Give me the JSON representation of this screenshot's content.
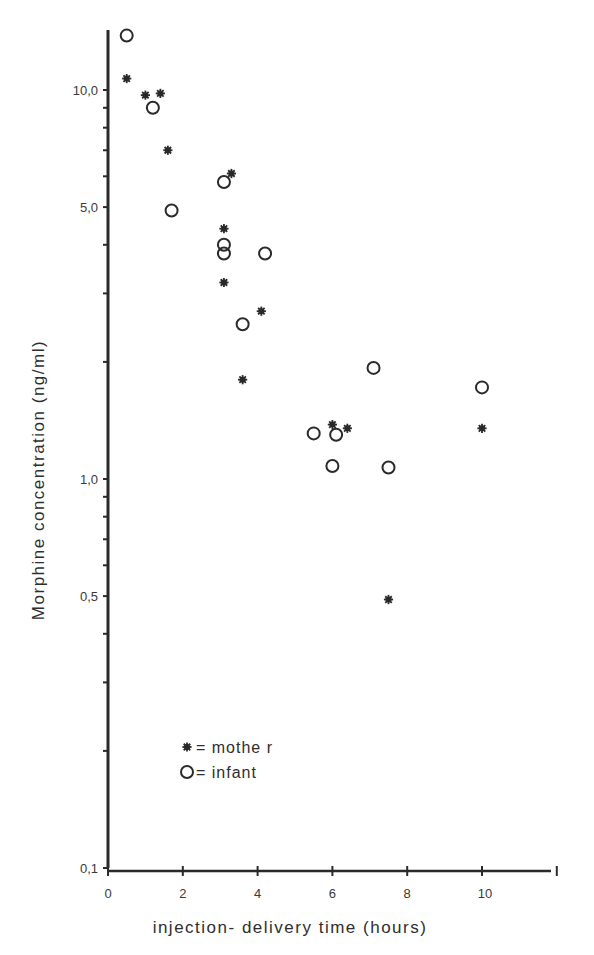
{
  "chart_data": {
    "type": "scatter",
    "title": "",
    "xlabel": "injection- delivery  time  (hours)",
    "ylabel": "Morphine  concentration  (ng/ml)",
    "xlim": [
      0,
      12
    ],
    "ylim": [
      0.1,
      15
    ],
    "yscale": "log",
    "grid": false,
    "legend_position": "lower-left inside",
    "x_ticks": [
      0,
      2,
      4,
      6,
      8,
      10
    ],
    "x_tick_labels": [
      "0",
      "2",
      "4",
      "6",
      "8",
      "10"
    ],
    "y_ticks": [
      0.1,
      0.5,
      1.0,
      5.0,
      10.0
    ],
    "y_tick_labels": [
      "0,1",
      "0,5",
      "1,0",
      "5,0",
      "10,0"
    ],
    "series": [
      {
        "name": "mother",
        "legend_label": "= mothe r",
        "marker": "asterisk",
        "points": [
          {
            "x": 0.5,
            "y": 10.7
          },
          {
            "x": 1.0,
            "y": 9.7
          },
          {
            "x": 1.4,
            "y": 9.8
          },
          {
            "x": 1.6,
            "y": 7.0
          },
          {
            "x": 3.3,
            "y": 6.1
          },
          {
            "x": 3.1,
            "y": 4.4
          },
          {
            "x": 3.1,
            "y": 3.2
          },
          {
            "x": 4.1,
            "y": 2.7
          },
          {
            "x": 3.6,
            "y": 1.8
          },
          {
            "x": 6.0,
            "y": 1.38
          },
          {
            "x": 6.4,
            "y": 1.35
          },
          {
            "x": 10.0,
            "y": 1.35
          },
          {
            "x": 7.5,
            "y": 0.49
          }
        ]
      },
      {
        "name": "infant",
        "legend_label": "= infant",
        "marker": "open-circle",
        "points": [
          {
            "x": 0.5,
            "y": 13.8
          },
          {
            "x": 1.2,
            "y": 9.0
          },
          {
            "x": 1.7,
            "y": 4.9
          },
          {
            "x": 3.1,
            "y": 5.8
          },
          {
            "x": 3.1,
            "y": 4.0
          },
          {
            "x": 3.1,
            "y": 3.8
          },
          {
            "x": 4.2,
            "y": 3.8
          },
          {
            "x": 3.6,
            "y": 2.5
          },
          {
            "x": 7.1,
            "y": 1.93
          },
          {
            "x": 10.0,
            "y": 1.72
          },
          {
            "x": 5.5,
            "y": 1.31
          },
          {
            "x": 6.1,
            "y": 1.3
          },
          {
            "x": 6.0,
            "y": 1.08
          },
          {
            "x": 7.5,
            "y": 1.07
          }
        ]
      }
    ]
  },
  "colors": {
    "ink": "#2a2a2a",
    "background": "#ffffff"
  }
}
